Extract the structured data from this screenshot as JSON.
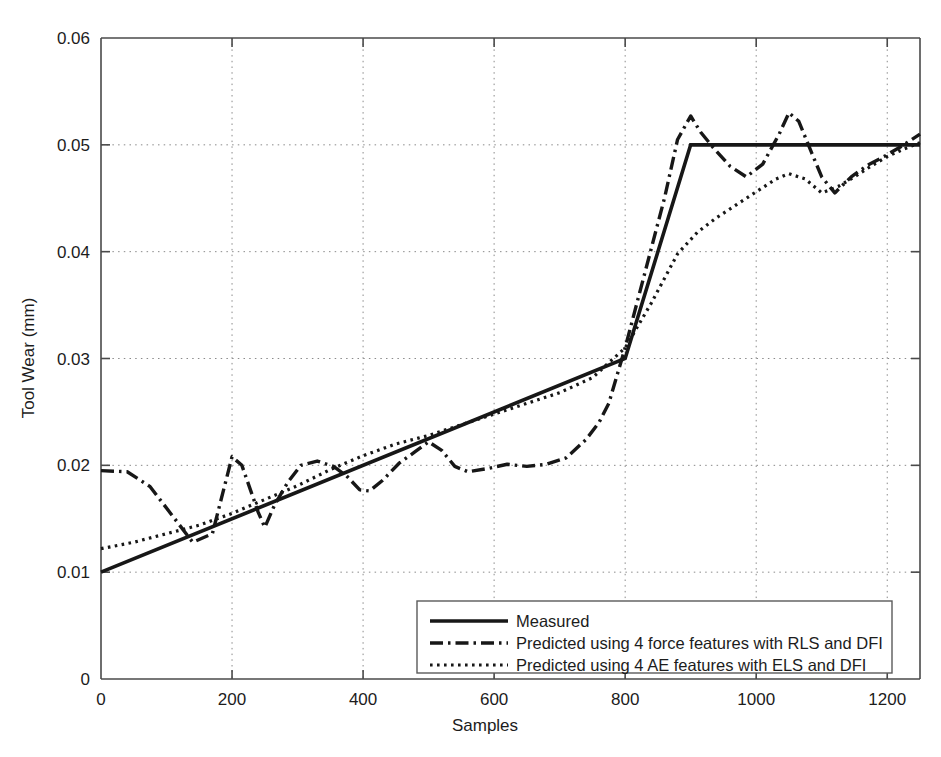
{
  "chart_data": {
    "type": "line",
    "title": "",
    "xlabel": "Samples",
    "ylabel": "Tool Wear (mm)",
    "xlim": [
      0,
      1250
    ],
    "ylim": [
      0,
      0.06
    ],
    "xticks": [
      0,
      200,
      400,
      600,
      800,
      1000,
      1200
    ],
    "xticklabels": [
      "0",
      "200",
      "400",
      "600",
      "800",
      "1000",
      "1200"
    ],
    "yticks": [
      0,
      0.01,
      0.02,
      0.03,
      0.04,
      0.05,
      0.06
    ],
    "yticklabels": [
      "0",
      "0.01",
      "0.02",
      "0.03",
      "0.04",
      "0.05",
      "0.06"
    ],
    "grid": true,
    "grid_style": "dotted",
    "legend_position": "lower center",
    "series": [
      {
        "name": "Measured",
        "style": "solid",
        "color": "#171717",
        "x": [
          0,
          800,
          900,
          1250
        ],
        "y": [
          0.01,
          0.03,
          0.05,
          0.05
        ]
      },
      {
        "name": "Predicted using 4 force features with RLS and DFI",
        "style": "dash-dot",
        "color": "#171717",
        "x": [
          0,
          40,
          75,
          110,
          140,
          170,
          200,
          215,
          240,
          250,
          265,
          285,
          305,
          330,
          355,
          375,
          395,
          410,
          430,
          455,
          480,
          500,
          520,
          540,
          560,
          590,
          620,
          650,
          680,
          710,
          740,
          760,
          775,
          800,
          830,
          860,
          880,
          900,
          915,
          935,
          960,
          985,
          1010,
          1035,
          1050,
          1065,
          1085,
          1100,
          1120,
          1145,
          1170,
          1195,
          1220,
          1250
        ],
        "y": [
          0.0195,
          0.0194,
          0.018,
          0.0152,
          0.0128,
          0.0136,
          0.0208,
          0.02,
          0.0156,
          0.0142,
          0.0163,
          0.0184,
          0.02,
          0.0204,
          0.0199,
          0.019,
          0.0177,
          0.0176,
          0.0186,
          0.0202,
          0.0213,
          0.0222,
          0.0214,
          0.0199,
          0.0194,
          0.0197,
          0.0201,
          0.0199,
          0.0201,
          0.0207,
          0.0224,
          0.024,
          0.0258,
          0.031,
          0.038,
          0.045,
          0.0505,
          0.0527,
          0.0512,
          0.0497,
          0.048,
          0.047,
          0.0482,
          0.051,
          0.053,
          0.0522,
          0.0492,
          0.047,
          0.0455,
          0.047,
          0.0481,
          0.0489,
          0.0498,
          0.051
        ]
      },
      {
        "name": "Predicted using 4 AE features with ELS and DFI",
        "style": "dotted",
        "color": "#171717",
        "x": [
          0,
          50,
          100,
          150,
          200,
          250,
          300,
          350,
          400,
          450,
          500,
          550,
          600,
          650,
          700,
          750,
          800,
          840,
          880,
          910,
          940,
          970,
          1000,
          1030,
          1050,
          1075,
          1100,
          1125,
          1150,
          1175,
          1200,
          1225,
          1250
        ],
        "y": [
          0.0122,
          0.0128,
          0.0136,
          0.0144,
          0.0155,
          0.0168,
          0.0181,
          0.0196,
          0.0209,
          0.022,
          0.0228,
          0.0238,
          0.0248,
          0.0258,
          0.0268,
          0.0282,
          0.031,
          0.0352,
          0.0398,
          0.0418,
          0.0432,
          0.0444,
          0.0456,
          0.0468,
          0.0473,
          0.0468,
          0.0455,
          0.0461,
          0.047,
          0.048,
          0.0489,
          0.0496,
          0.0502
        ]
      }
    ]
  },
  "legend": {
    "entries": [
      {
        "label": "Measured",
        "style": "solid"
      },
      {
        "label": "Predicted using 4 force features with RLS and DFI",
        "style": "dash-dot"
      },
      {
        "label": "Predicted using 4 AE features with ELS and DFI",
        "style": "dotted"
      }
    ]
  }
}
